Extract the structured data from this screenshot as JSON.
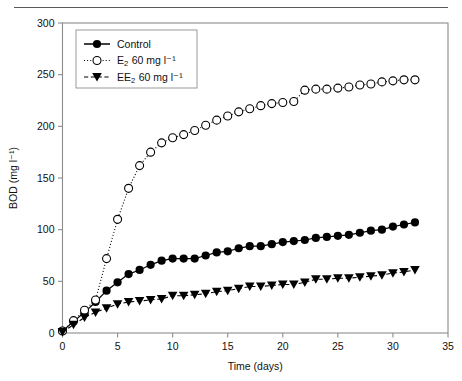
{
  "figure": {
    "background_color": "#ffffff",
    "frame_color": "#8c8c8c",
    "series_color": "#000000",
    "top_rule": true
  },
  "chart_data": {
    "type": "scatter",
    "title": "",
    "subtitle": "",
    "xlabel": "Time (days)",
    "ylabel": "BOD (mg l⁻¹)",
    "ylabel_plain": "BOD (mg l-1)",
    "xlim": [
      0,
      35
    ],
    "ylim": [
      0,
      300
    ],
    "xticks": [
      0,
      5,
      10,
      15,
      20,
      25,
      30,
      35
    ],
    "yticks": [
      0,
      50,
      100,
      150,
      200,
      250,
      300
    ],
    "xtick_labels": [
      "0",
      "5",
      "10",
      "15",
      "20",
      "25",
      "30",
      "35"
    ],
    "ytick_labels": [
      "0",
      "50",
      "100",
      "150",
      "200",
      "250",
      "300"
    ],
    "grid": false,
    "legend_position": "upper left",
    "series": [
      {
        "name": "Control",
        "label_main": "Control",
        "label_sub": "",
        "label_tail": "",
        "marker": "filled-circle",
        "linestyle": "solid",
        "color": "#000000",
        "x": [
          0,
          1,
          2,
          3,
          4,
          5,
          6,
          7,
          8,
          9,
          10,
          11,
          12,
          13,
          14,
          15,
          16,
          17,
          18,
          19,
          20,
          21,
          22,
          23,
          24,
          25,
          26,
          27,
          28,
          29,
          30,
          31,
          32
        ],
        "y": [
          2,
          11,
          20,
          30,
          41,
          49,
          57,
          61,
          66,
          70,
          72,
          72,
          72,
          75,
          78,
          79,
          82,
          84,
          84,
          86,
          88,
          89,
          90,
          92,
          93,
          94,
          95,
          97,
          99,
          100,
          103,
          105,
          107
        ]
      },
      {
        "name": "E2 60 mg l-1",
        "label_main": "E",
        "label_sub": "2",
        "label_tail": "60 mg l⁻¹",
        "marker": "open-circle",
        "linestyle": "dotted",
        "color": "#000000",
        "x": [
          0,
          1,
          2,
          3,
          4,
          5,
          6,
          7,
          8,
          9,
          10,
          11,
          12,
          13,
          14,
          15,
          16,
          17,
          18,
          19,
          20,
          21,
          22,
          23,
          24,
          25,
          26,
          27,
          28,
          29,
          30,
          31,
          32
        ],
        "y": [
          2,
          12,
          22,
          32,
          72,
          110,
          140,
          162,
          175,
          184,
          189,
          192,
          196,
          201,
          206,
          210,
          214,
          217,
          220,
          222,
          223,
          224,
          235,
          236,
          236,
          237,
          238,
          240,
          241,
          243,
          244,
          245,
          245
        ]
      },
      {
        "name": "EE2 60 mg l-1",
        "label_main": "EE",
        "label_sub": "2",
        "label_tail": "60 mg l⁻¹",
        "marker": "filled-triangle-down",
        "linestyle": "dashed",
        "color": "#000000",
        "x": [
          0,
          1,
          2,
          3,
          4,
          5,
          6,
          7,
          8,
          9,
          10,
          11,
          12,
          13,
          14,
          15,
          16,
          17,
          18,
          19,
          20,
          21,
          22,
          23,
          24,
          25,
          26,
          27,
          28,
          29,
          30,
          31,
          32
        ],
        "y": [
          1,
          8,
          15,
          20,
          24,
          28,
          30,
          31,
          32,
          33,
          36,
          36,
          37,
          38,
          40,
          41,
          43,
          45,
          45,
          46,
          47,
          47,
          49,
          52,
          52,
          53,
          53,
          54,
          55,
          56,
          58,
          59,
          61
        ]
      }
    ]
  },
  "legend": {
    "entries": [
      {
        "label_main": "Control",
        "label_sub": "",
        "label_tail": "",
        "marker": "filled-circle",
        "linestyle": "solid"
      },
      {
        "label_main": "E",
        "label_sub": "2",
        "label_tail": "60 mg l⁻¹",
        "marker": "open-circle",
        "linestyle": "dotted"
      },
      {
        "label_main": "EE",
        "label_sub": "2",
        "label_tail": "60 mg l⁻¹",
        "marker": "filled-triangle-down",
        "linestyle": "dashed"
      }
    ]
  }
}
